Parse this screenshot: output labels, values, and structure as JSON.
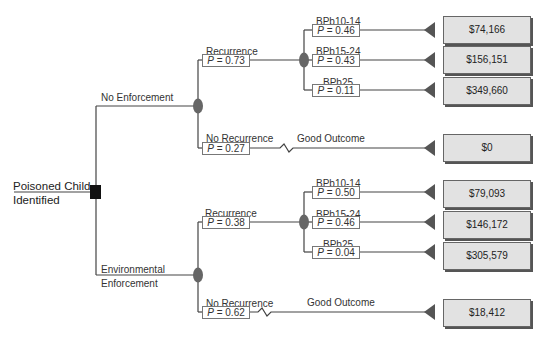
{
  "diagram": {
    "type": "decision-tree",
    "root": {
      "label_line1": "Poisoned Child",
      "label_line2": "Identified",
      "node_type": "decision"
    },
    "strategies": [
      {
        "label": "No Enforcement",
        "recurrence": {
          "label": "Recurrence",
          "p": "P = 0.73",
          "outcomes": [
            {
              "label": "BPb10-14",
              "p": "P = 0.46",
              "payoff": "$74,166"
            },
            {
              "label": "BPb15-24",
              "p": "P = 0.43",
              "payoff": "$156,151"
            },
            {
              "label": "BPb25",
              "p": "P = 0.11",
              "payoff": "$349,660"
            }
          ]
        },
        "no_recurrence": {
          "label": "No Recurrence",
          "p": "P = 0.27",
          "outcome_label": "Good Outcome",
          "payoff": "$0"
        }
      },
      {
        "label_line1": "Environmental",
        "label_line2": "Enforcement",
        "recurrence": {
          "label": "Recurrence",
          "p": "P = 0.38",
          "outcomes": [
            {
              "label": "BPb10-14",
              "p": "P = 0.50",
              "payoff": "$79,093"
            },
            {
              "label": "BPb15-24",
              "p": "P = 0.46",
              "payoff": "$146,172"
            },
            {
              "label": "BPb25",
              "p": "P = 0.04",
              "payoff": "$305,579"
            }
          ]
        },
        "no_recurrence": {
          "label": "No Recurrence",
          "p": "P = 0.62",
          "outcome_label": "Good Outcome",
          "payoff": "$18,412"
        }
      }
    ],
    "colors": {
      "line": "#444444",
      "chance_node": "#666666",
      "decision_node": "#111111",
      "terminal": "#555555",
      "payoff_fill": "#e2e2e2"
    }
  }
}
